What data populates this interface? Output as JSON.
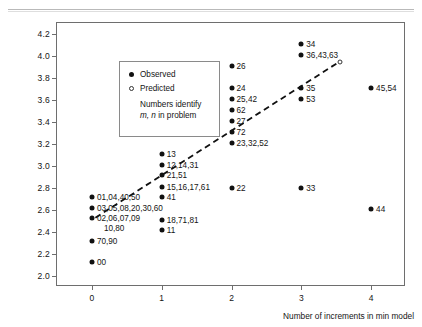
{
  "figure": {
    "top_rule": "horizontal-rule"
  },
  "axes": {
    "y_title": "Mean success latency in seconds",
    "x_title": "Number of increments in min model",
    "y_ticks": [
      "4.2",
      "4.0",
      "3.8",
      "3.6",
      "3.4",
      "3.2",
      "3.0",
      "2.8",
      "2.6",
      "2.4",
      "2.2",
      "2.0"
    ],
    "x_ticks": [
      "0",
      "1",
      "2",
      "3",
      "4"
    ]
  },
  "legend": {
    "observed_label": "Observed",
    "predicted_label": "Predicted",
    "note_line1": "Numbers identify",
    "note_line2_italic": "m, n",
    "note_line2_rest": " in problem",
    "note_line2": "m, n in problem"
  },
  "chart_data": {
    "type": "scatter",
    "title": "",
    "xlabel": "Number of increments in min model",
    "ylabel": "Mean success latency in seconds",
    "xlim": [
      -0.5,
      4.5
    ],
    "ylim": [
      1.9,
      4.3
    ],
    "grid": false,
    "legend_position": "top-left-inset",
    "series": [
      {
        "name": "Observed",
        "marker": "filled-circle",
        "points": [
          {
            "x": 0,
            "y": 2.72,
            "label": "01,04,40,50"
          },
          {
            "x": 0,
            "y": 2.62,
            "label": "03,05,08,20,30,60"
          },
          {
            "x": 0,
            "y": 2.53,
            "label": "02,06,07,09 , 10,80"
          },
          {
            "x": 0,
            "y": 2.32,
            "label": "70,90"
          },
          {
            "x": 0,
            "y": 2.13,
            "label": "00"
          },
          {
            "x": 1,
            "y": 3.11,
            "label": "13"
          },
          {
            "x": 1,
            "y": 3.01,
            "label": "12,14,31"
          },
          {
            "x": 1,
            "y": 2.92,
            "label": "21,51"
          },
          {
            "x": 1,
            "y": 2.81,
            "label": "15,16,17,61"
          },
          {
            "x": 1,
            "y": 2.72,
            "label": "41"
          },
          {
            "x": 1,
            "y": 2.51,
            "label": "18,71,81"
          },
          {
            "x": 1,
            "y": 2.42,
            "label": "11"
          },
          {
            "x": 2,
            "y": 3.91,
            "label": "26"
          },
          {
            "x": 2,
            "y": 3.71,
            "label": "24"
          },
          {
            "x": 2,
            "y": 3.61,
            "label": "25,42"
          },
          {
            "x": 2,
            "y": 3.51,
            "label": "62"
          },
          {
            "x": 2,
            "y": 3.41,
            "label": "27"
          },
          {
            "x": 2,
            "y": 3.31,
            "label": "72"
          },
          {
            "x": 2,
            "y": 3.21,
            "label": "23,32,52"
          },
          {
            "x": 2,
            "y": 2.8,
            "label": "22"
          },
          {
            "x": 3,
            "y": 4.11,
            "label": "34"
          },
          {
            "x": 3,
            "y": 4.01,
            "label": "36,43,63"
          },
          {
            "x": 3,
            "y": 3.71,
            "label": "35"
          },
          {
            "x": 3,
            "y": 3.61,
            "label": "53"
          },
          {
            "x": 3,
            "y": 2.8,
            "label": "33"
          },
          {
            "x": 4,
            "y": 3.71,
            "label": "45,54"
          },
          {
            "x": 4,
            "y": 2.61,
            "label": "44"
          }
        ]
      },
      {
        "name": "Predicted",
        "marker": "open-circle",
        "style": "dashed-line",
        "points": [
          {
            "x": 0.05,
            "y": 2.53
          },
          {
            "x": 3.55,
            "y": 3.95
          }
        ]
      }
    ]
  }
}
